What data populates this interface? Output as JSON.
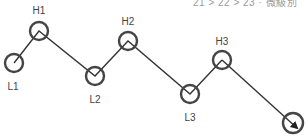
{
  "header": {
    "cropped_text": "21 > 22 > 23 · 微級別"
  },
  "diagram": {
    "type": "zigzag-swing-points",
    "line_color": "#333333",
    "circle_color": "#444444",
    "nodes": [
      {
        "id": "L1",
        "label": "L1",
        "x": 14,
        "y": 63,
        "label_x": 13,
        "label_y": 90
      },
      {
        "id": "H1",
        "label": "H1",
        "x": 39,
        "y": 31,
        "label_x": 39,
        "label_y": 14
      },
      {
        "id": "L2",
        "label": "L2",
        "x": 95,
        "y": 76,
        "label_x": 95,
        "label_y": 103
      },
      {
        "id": "H2",
        "label": "H2",
        "x": 128,
        "y": 41,
        "label_x": 128,
        "label_y": 25
      },
      {
        "id": "L3",
        "label": "L3",
        "x": 190,
        "y": 94,
        "label_x": 190,
        "label_y": 121
      },
      {
        "id": "H3",
        "label": "H3",
        "x": 222,
        "y": 60,
        "label_x": 222,
        "label_y": 45
      }
    ],
    "end": {
      "id": "arrow-end",
      "x": 293,
      "y": 123
    }
  }
}
